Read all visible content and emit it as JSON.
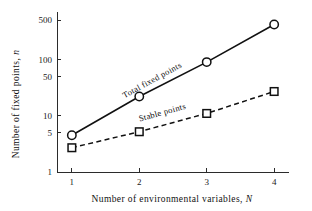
{
  "chart_data": {
    "type": "line",
    "title": "",
    "xlabel": "Number of environmental variables, N",
    "xlabel_plain": "Number of environmental variables,",
    "xlabel_italic": "N",
    "ylabel": "Number of fixed points, n",
    "ylabel_plain": "Number of  fixed  points,",
    "ylabel_italic": "n",
    "x": [
      1,
      2,
      3,
      4
    ],
    "xticklabels": [
      "1",
      "2",
      "3",
      "4"
    ],
    "xlim": [
      0.78,
      4.22
    ],
    "yscale": "log",
    "ylim": [
      1,
      700
    ],
    "yticks": [
      1,
      5,
      10,
      50,
      100,
      500
    ],
    "yticklabels": [
      "1",
      "5",
      "10",
      "50",
      "100",
      "500"
    ],
    "grid": false,
    "legend": "inline-labels",
    "series": [
      {
        "name": "Total fixed points",
        "label": "Total fixed points",
        "marker": "circle",
        "linestyle": "solid",
        "color": "#111111",
        "values": [
          4.5,
          22,
          90,
          420
        ]
      },
      {
        "name": "Stable points",
        "label": "Stable points",
        "marker": "square",
        "linestyle": "dashed",
        "color": "#111111",
        "values": [
          2.7,
          5.2,
          11,
          27
        ]
      }
    ],
    "annotations": [
      {
        "text": "Total fixed points",
        "series": 0
      },
      {
        "text": "Stable points",
        "series": 1
      }
    ]
  },
  "figure": {
    "background_color": "#ffffff",
    "foreground_color": "#111111"
  }
}
